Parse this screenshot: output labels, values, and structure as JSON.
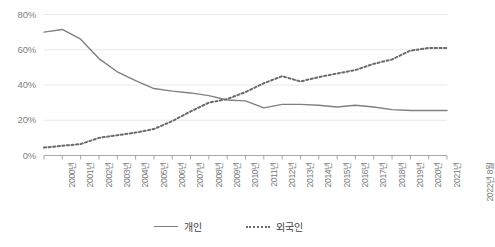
{
  "chart_data": {
    "type": "line",
    "title": "",
    "xlabel": "",
    "ylabel": "",
    "ylim": [
      0,
      80
    ],
    "ytick_labels": [
      "0%",
      "20%",
      "40%",
      "60%",
      "80%"
    ],
    "ytick_values": [
      0,
      20,
      40,
      60,
      80
    ],
    "grid": true,
    "legend_position": "bottom",
    "categories": [
      "2000년",
      "2001년",
      "2002년",
      "2003년",
      "2004년",
      "2005년",
      "2006년",
      "2007년",
      "2008년",
      "2009년",
      "2010년",
      "2011년",
      "2012년",
      "2013년",
      "2014년",
      "2015년",
      "2016년",
      "2017년",
      "2018년",
      "2019년",
      "2020년",
      "2021년",
      "2022년 8월"
    ],
    "series": [
      {
        "name": "개인",
        "style": "solid",
        "color": "#808080",
        "values": [
          70.0,
          71.5,
          66.0,
          55.0,
          47.5,
          42.5,
          38.0,
          36.5,
          35.5,
          34.0,
          31.5,
          31.0,
          27.0,
          29.0,
          29.0,
          28.5,
          27.5,
          28.5,
          27.5,
          26.0,
          25.5,
          25.5,
          25.5
        ]
      },
      {
        "name": "외국인",
        "style": "dotted",
        "color": "#6b6b6b",
        "values": [
          4.5,
          5.5,
          6.5,
          10.0,
          11.5,
          13.0,
          15.0,
          19.5,
          25.0,
          30.0,
          32.0,
          36.0,
          41.0,
          45.0,
          42.0,
          44.5,
          46.5,
          48.5,
          52.0,
          54.5,
          59.5,
          61.0,
          61.0
        ]
      }
    ]
  },
  "legend": {
    "items": [
      {
        "label": "개인"
      },
      {
        "label": "외국인"
      }
    ]
  }
}
